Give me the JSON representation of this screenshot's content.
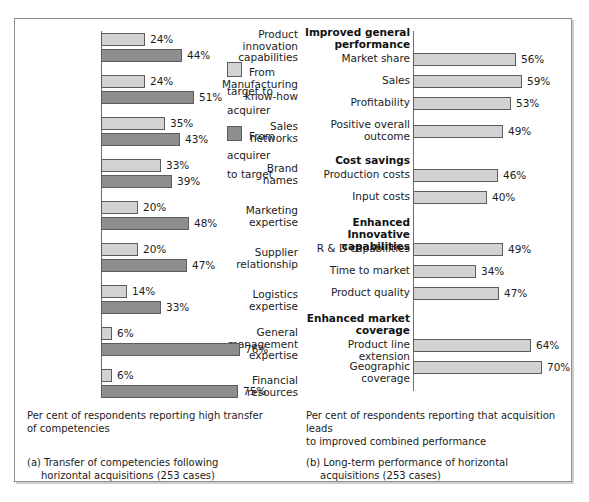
{
  "chart_data": [
    {
      "type": "bar",
      "id": "panel-a",
      "orientation": "horizontal",
      "title": "(a) Transfer of competencies following\nhorizontal acquisitions (253 cases)",
      "axis_note": "Per cent of respondents reporting high transfer\nof competencies",
      "xlabel": "",
      "ylabel": "",
      "xlim": [
        0,
        80
      ],
      "grid": false,
      "legend_position": "right",
      "categories": [
        "Product\ninnovation\ncapabilities",
        "Manufacturing\nknow-how",
        "Sales\nnetworks",
        "Brand\nnames",
        "Marketing\nexpertise",
        "Supplier\nrelationship",
        "Logistics\nexpertise",
        "General\nmanagement\nexpertise",
        "Financial\nresources"
      ],
      "series": [
        {
          "name": "From\ntarget to\nacquirer",
          "color": "#d2d2d2",
          "values": [
            24,
            24,
            35,
            33,
            20,
            20,
            14,
            6,
            6
          ],
          "labels": [
            "24%",
            "24%",
            "35%",
            "33%",
            "20%",
            "20%",
            "14%",
            "6%",
            "6%"
          ]
        },
        {
          "name": "From\nacquirer\nto target",
          "color": "#8e8e8e",
          "values": [
            44,
            51,
            43,
            39,
            48,
            47,
            33,
            76,
            75
          ],
          "labels": [
            "44%",
            "51%",
            "43%",
            "39%",
            "48%",
            "47%",
            "33%",
            "76%",
            "75%"
          ]
        }
      ]
    },
    {
      "type": "bar",
      "id": "panel-b",
      "orientation": "horizontal",
      "title": "(b) Long-term performance of horizontal\nacquisitions (253 cases)",
      "axis_note": "Per cent of respondents reporting that acquisition leads\nto improved combined performance",
      "xlabel": "",
      "ylabel": "",
      "xlim": [
        0,
        80
      ],
      "grid": false,
      "legend_position": "none",
      "sections": [
        {
          "heading": "Improved general\nperformance",
          "categories": [
            "Market share",
            "Sales",
            "Profitability",
            "Positive overall\noutcome"
          ],
          "values": [
            56,
            59,
            53,
            49
          ],
          "labels": [
            "56%",
            "59%",
            "53%",
            "49%"
          ]
        },
        {
          "heading": "Cost savings",
          "categories": [
            "Production costs",
            "Input costs"
          ],
          "values": [
            46,
            40
          ],
          "labels": [
            "46%",
            "40%"
          ]
        },
        {
          "heading": "Enhanced Innovative\ncapabilities",
          "categories": [
            "R & D capabilities",
            "Time to market",
            "Product quality"
          ],
          "values": [
            49,
            34,
            47
          ],
          "labels": [
            "49%",
            "34%",
            "47%"
          ]
        },
        {
          "heading": "Enhanced market\ncoverage",
          "categories": [
            "Product line extension",
            "Geographic coverage"
          ],
          "values": [
            64,
            70
          ],
          "labels": [
            "64%",
            "70%"
          ]
        }
      ],
      "bar_color": "#d2d2d2"
    }
  ],
  "panel_a": {
    "legend": [
      {
        "label": "From\ntarget to\nacquirer"
      },
      {
        "label": "From\nacquirer\nto target"
      }
    ],
    "rows": [
      {
        "label": "Product\ninnovation\ncapabilities",
        "light": "24%",
        "dark": "44%"
      },
      {
        "label": "Manufacturing\nknow-how",
        "light": "24%",
        "dark": "51%"
      },
      {
        "label": "Sales\nnetworks",
        "light": "35%",
        "dark": "43%"
      },
      {
        "label": "Brand\nnames",
        "light": "33%",
        "dark": "39%"
      },
      {
        "label": "Marketing\nexpertise",
        "light": "20%",
        "dark": "48%"
      },
      {
        "label": "Supplier\nrelationship",
        "light": "20%",
        "dark": "47%"
      },
      {
        "label": "Logistics\nexpertise",
        "light": "14%",
        "dark": "33%"
      },
      {
        "label": "General\nmanagement\nexpertise",
        "light": "6%",
        "dark": "76%"
      },
      {
        "label": "Financial\nresources",
        "light": "6%",
        "dark": "75%"
      }
    ],
    "note": "Per cent of respondents reporting high transfer\nof competencies",
    "caption_prefix": "(a) ",
    "caption": "(a) Transfer of competencies following",
    "caption_cont": "horizontal acquisitions (253 cases)"
  },
  "panel_b": {
    "headings": [
      "Improved general\nperformance",
      "Cost savings",
      "Enhanced Innovative\ncapabilities",
      "Enhanced market\ncoverage"
    ],
    "rows": [
      {
        "label": "Market share",
        "value": "56%"
      },
      {
        "label": "Sales",
        "value": "59%"
      },
      {
        "label": "Profitability",
        "value": "53%"
      },
      {
        "label": "Positive overall\noutcome",
        "value": "49%"
      },
      {
        "label": "Production costs",
        "value": "46%"
      },
      {
        "label": "Input costs",
        "value": "40%"
      },
      {
        "label": "R & D capabilities",
        "value": "49%"
      },
      {
        "label": "Time to market",
        "value": "34%"
      },
      {
        "label": "Product quality",
        "value": "47%"
      },
      {
        "label": "Product line extension",
        "value": "64%"
      },
      {
        "label": "Geographic coverage",
        "value": "70%"
      }
    ],
    "note": "Per cent of respondents reporting that acquisition leads\nto improved combined performance",
    "caption": "(b) Long-term performance of horizontal",
    "caption_cont": "acquisitions (253 cases)"
  },
  "colors": {
    "light_bar": "#d2d2d2",
    "dark_bar": "#8e8e8e",
    "bar_border": "#5d5d5d",
    "frame": "#8d8d8d"
  }
}
